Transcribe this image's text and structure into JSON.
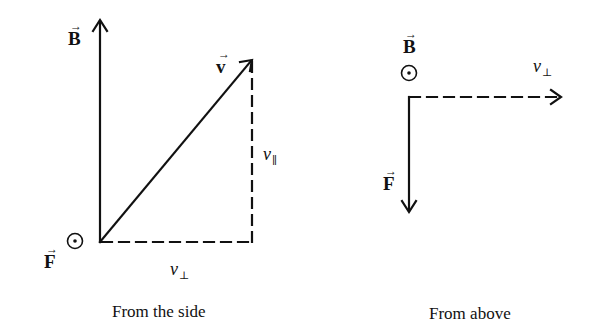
{
  "panels": [
    {
      "caption": "From the side",
      "labels": {
        "B": "B",
        "v": "v",
        "F": "F",
        "v_parallel_base": "v",
        "v_parallel_sub": "∥",
        "v_perp_base": "v",
        "v_perp_sub": "⊥"
      },
      "out_of_page_symbol": "⊙"
    },
    {
      "caption": "From above",
      "labels": {
        "B": "B",
        "F": "F",
        "v_perp_base": "v",
        "v_perp_sub": "⊥"
      },
      "out_of_page_symbol": "⊙"
    }
  ],
  "vector_arrow": "→"
}
